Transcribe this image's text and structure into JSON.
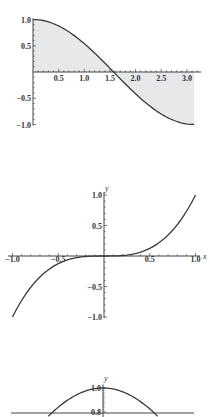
{
  "colors": {
    "curve": "#3a3a3a",
    "axis": "#444444",
    "fill": "#e6e8ea",
    "text": "#333333"
  },
  "chart_data": [
    {
      "type": "area",
      "title": "",
      "function": "cos(x)",
      "x": [
        0,
        0.5,
        1.0,
        1.5,
        1.5708,
        2.0,
        2.5,
        3.0,
        3.1416
      ],
      "values": [
        1.0,
        0.878,
        0.54,
        0.071,
        0.0,
        -0.416,
        -0.801,
        -0.99,
        -1.0
      ],
      "filling": "to axis",
      "xlabel": "",
      "ylabel": "",
      "xlim": [
        0,
        3.1416
      ],
      "ylim": [
        -1.0,
        1.0
      ],
      "x_ticks": [
        "0.5",
        "1.0",
        "1.5",
        "2.0",
        "2.5",
        "3.0"
      ],
      "y_ticks": [
        "1.0",
        "0.5",
        "-0.5",
        "-1.0"
      ],
      "grid": false
    },
    {
      "type": "line",
      "title": "",
      "function": "x^3",
      "x": [
        -1.0,
        -0.5,
        0,
        0.5,
        1.0
      ],
      "values": [
        -1.0,
        -0.125,
        0,
        0.125,
        1.0
      ],
      "xlabel": "x",
      "ylabel": "y",
      "xlim": [
        -1.0,
        1.0
      ],
      "ylim": [
        -1.0,
        1.0
      ],
      "x_ticks": [
        "-1.0",
        "-0.5",
        "0.5",
        "1.0"
      ],
      "y_ticks": [
        "1.0",
        "0.5",
        "-0.5",
        "-1.0"
      ],
      "grid": false
    },
    {
      "type": "line",
      "title": "",
      "function": "cos(x)",
      "x": [
        -0.6435,
        0,
        0.6435
      ],
      "values": [
        0.8,
        1.0,
        0.8
      ],
      "xlabel": "",
      "ylabel": "y",
      "ylim": [
        0.8,
        1.0
      ],
      "y_ticks": [
        "1.0",
        "0.8"
      ],
      "grid": false,
      "note": "plot cropped at bottom edge"
    }
  ],
  "plot1": {
    "x_ticks": [
      {
        "v": 0.5,
        "label": "0.5"
      },
      {
        "v": 1.0,
        "label": "1.0"
      },
      {
        "v": 1.5,
        "label": "1.5"
      },
      {
        "v": 2.0,
        "label": "2.0"
      },
      {
        "v": 2.5,
        "label": "2.5"
      },
      {
        "v": 3.0,
        "label": "3.0"
      }
    ],
    "y_ticks": [
      {
        "v": 1.0,
        "label": "1.0"
      },
      {
        "v": 0.5,
        "label": "0.5"
      },
      {
        "v": -0.5,
        "label": "−0.5"
      },
      {
        "v": -1.0,
        "label": "−1.0"
      }
    ]
  },
  "plot2": {
    "x_axis_label": "x",
    "y_axis_label": "y",
    "x_ticks": [
      {
        "v": -1.0,
        "label": "−1.0"
      },
      {
        "v": -0.5,
        "label": "−0.5"
      },
      {
        "v": 0.5,
        "label": "0.5"
      },
      {
        "v": 1.0,
        "label": "1.0"
      }
    ],
    "y_ticks": [
      {
        "v": 1.0,
        "label": "1.0"
      },
      {
        "v": 0.5,
        "label": "0.5"
      },
      {
        "v": -0.5,
        "label": "−0.5"
      },
      {
        "v": -1.0,
        "label": "−1.0"
      }
    ]
  },
  "plot3": {
    "y_axis_label": "y",
    "y_ticks": [
      {
        "v": 1.0,
        "label": "1.0"
      },
      {
        "v": 0.8,
        "label": "0.8"
      }
    ]
  }
}
